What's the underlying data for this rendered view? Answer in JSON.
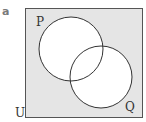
{
  "part_label": "a",
  "venn": {
    "universe_label": "U",
    "sets": [
      {
        "label": "P",
        "cx": 71,
        "cy": 49,
        "r": 32
      },
      {
        "label": "Q",
        "cx": 101,
        "cy": 77,
        "r": 31
      }
    ],
    "shaded_region": "complement of (P ∪ Q)",
    "colors": {
      "universe_fill": "#e5e5e5",
      "set_fill": "#ffffff",
      "stroke": "#333333"
    }
  }
}
